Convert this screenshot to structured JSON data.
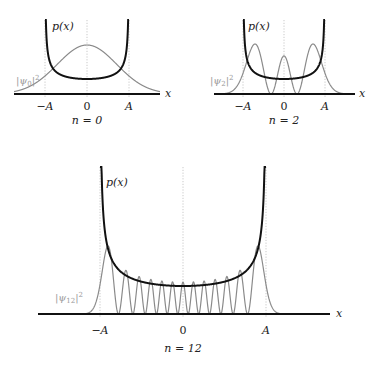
{
  "panels": [
    {
      "id": "n0",
      "n": 0,
      "caption": "n = 0",
      "p_label": "p(x)",
      "psi_label": "|ψ0|²",
      "psi_label_main": "|ψ",
      "psi_label_sub": "0",
      "psi_label_sup": "2",
      "x_label": "x",
      "ticks": [
        "−A",
        "0",
        "A"
      ],
      "geom": {
        "cx": 87,
        "A": 42,
        "axis_y": 94,
        "axis_x0": 14,
        "axis_x1": 160,
        "wall_top": 20,
        "p_min_y": 79,
        "psi_peak_y": 45,
        "psi_scale": 1.0,
        "tick_y": 110,
        "caption_y": 124,
        "p_label_x": 52,
        "p_label_y": 30,
        "psi_label_x": 16,
        "psi_label_y": 84,
        "x_label_x": 165
      }
    },
    {
      "id": "n2",
      "n": 2,
      "caption": "n = 2",
      "p_label": "p(x)",
      "psi_label": "|ψ2|²",
      "psi_label_main": "|ψ",
      "psi_label_sub": "2",
      "psi_label_sup": "2",
      "x_label": "x",
      "ticks": [
        "−A",
        "0",
        "A"
      ],
      "geom": {
        "cx": 284,
        "A": 41,
        "axis_y": 94,
        "axis_x0": 214,
        "axis_x1": 355,
        "wall_top": 20,
        "p_min_y": 79,
        "psi_peak_y": 44,
        "psi_scale": 1.0,
        "tick_y": 110,
        "caption_y": 124,
        "p_label_x": 248,
        "p_label_y": 30,
        "psi_label_x": 210,
        "psi_label_y": 84,
        "x_label_x": 359
      }
    },
    {
      "id": "n12",
      "n": 12,
      "caption": "n = 12",
      "p_label": "p(x)",
      "psi_label": "|ψ12|²",
      "psi_label_main": "|ψ",
      "psi_label_sub": "12",
      "psi_label_sup": "2",
      "x_label": "x",
      "ticks": [
        "−A",
        "0",
        "A"
      ],
      "geom": {
        "cx": 183,
        "A": 83,
        "axis_y": 314,
        "axis_x0": 38,
        "axis_x1": 330,
        "wall_top": 167,
        "p_min_y": 286,
        "psi_peak_y": 246,
        "psi_scale": 1.0,
        "tick_y": 334,
        "caption_y": 352,
        "p_label_x": 106,
        "p_label_y": 186,
        "psi_label_x": 55,
        "psi_label_y": 301,
        "x_label_x": 336
      }
    }
  ],
  "colors": {
    "p_curve": "#111111",
    "psi_curve": "#8a8a8a",
    "axis": "#111111",
    "guide": "#bbbbbb",
    "psi_label": "#9a9a9a"
  }
}
